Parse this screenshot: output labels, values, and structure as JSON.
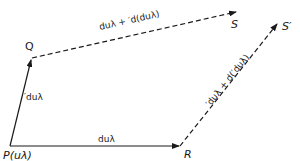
{
  "diagram": {
    "points": {
      "P": {
        "label": "P(uλ)"
      },
      "Q": {
        "label": "Q"
      },
      "R": {
        "label": "R"
      },
      "S": {
        "label": "S"
      },
      "S_prime": {
        "label": "S′"
      }
    },
    "vectors": {
      "PQ": {
        "label": "′duλ",
        "style": "solid"
      },
      "PR": {
        "label": "duλ",
        "style": "solid"
      },
      "QS": {
        "label": "duλ + ′d(duλ)",
        "style": "dashed"
      },
      "RS_prime": {
        "label": "′duλ + d(′duλ)",
        "style": "dashed"
      }
    },
    "colors": {
      "ink": "#1a1a1a",
      "background": "#ffffff"
    }
  }
}
